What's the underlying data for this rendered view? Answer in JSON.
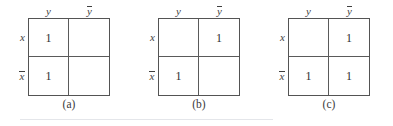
{
  "figure": {
    "type": "karnaugh-maps",
    "colors": {
      "border": "#545454",
      "inner_line": "#5a5a5a",
      "text": "#3a3a3a",
      "rule": "#e4e6ea",
      "background": "#ffffff"
    },
    "bottom_rule": true,
    "maps": [
      {
        "caption": "(a)",
        "col_headers": [
          {
            "text": "y",
            "overbar": false
          },
          {
            "text": "y",
            "overbar": true
          }
        ],
        "row_headers": [
          {
            "text": "x",
            "overbar": false
          },
          {
            "text": "x",
            "overbar": true
          }
        ],
        "cells": [
          {
            "position": "top-left",
            "value": "1"
          },
          {
            "position": "top-right",
            "value": ""
          },
          {
            "position": "bottom-left",
            "value": "1"
          },
          {
            "position": "bottom-right",
            "value": ""
          }
        ]
      },
      {
        "caption": "(b)",
        "col_headers": [
          {
            "text": "y",
            "overbar": false
          },
          {
            "text": "y",
            "overbar": true
          }
        ],
        "row_headers": [
          {
            "text": "x",
            "overbar": false
          },
          {
            "text": "x",
            "overbar": true
          }
        ],
        "cells": [
          {
            "position": "top-left",
            "value": ""
          },
          {
            "position": "top-right",
            "value": "1"
          },
          {
            "position": "bottom-left",
            "value": "1"
          },
          {
            "position": "bottom-right",
            "value": ""
          }
        ]
      },
      {
        "caption": "(c)",
        "col_headers": [
          {
            "text": "y",
            "overbar": false
          },
          {
            "text": "y",
            "overbar": true
          }
        ],
        "row_headers": [
          {
            "text": "x",
            "overbar": false
          },
          {
            "text": "x",
            "overbar": true
          }
        ],
        "cells": [
          {
            "position": "top-left",
            "value": ""
          },
          {
            "position": "top-right",
            "value": "1"
          },
          {
            "position": "bottom-left",
            "value": "1"
          },
          {
            "position": "bottom-right",
            "value": "1"
          }
        ]
      }
    ]
  }
}
